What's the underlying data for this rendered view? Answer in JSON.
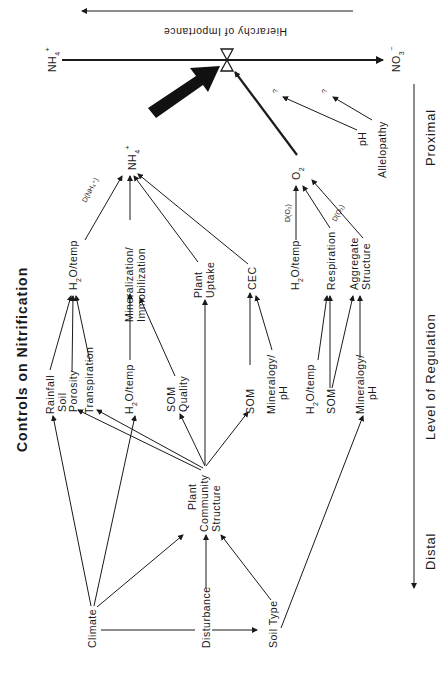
{
  "title": "Controls on Nitrification",
  "hierarchy_label": "Hierarchy of Importance",
  "axis": {
    "label": "Level of Regulation",
    "proximal": "Proximal",
    "distal": "Distal"
  },
  "main_line": {
    "left": "NH",
    "left_sub": "4",
    "left_sup": "+",
    "right": "NO",
    "right_sub": "3",
    "right_sup": "−"
  },
  "nodes": {
    "nh4": {
      "text": "NH",
      "sub": "4",
      "sup": "+"
    },
    "o2": {
      "text": "O",
      "sub": "2"
    },
    "ph_proximal": "pH",
    "allelopathy": "Allelopathy",
    "question1": "?",
    "question2": "?",
    "h2o_temp_nh4": {
      "pre": "H",
      "sub": "2",
      "post": "O/temp"
    },
    "mineralization": [
      "Mineralization/",
      "Immobilization"
    ],
    "plant_uptake": [
      "Plant",
      "Uptake"
    ],
    "cec": "CEC",
    "h2o_temp_o2": {
      "pre": "H",
      "sub": "2",
      "post": "O/temp"
    },
    "respiration": "Respiration",
    "aggregate_structure": [
      "Aggregate",
      "Structure"
    ],
    "rainfall": "Rainfall",
    "soil_porosity": [
      "Soil",
      "Porosity"
    ],
    "transpiration": "Transpiration",
    "h2o_temp_min": {
      "pre": "H",
      "sub": "2",
      "post": "O/temp"
    },
    "som_quality": [
      "SOM",
      "Quality"
    ],
    "som_cec": "SOM",
    "mineralogy_ph_cec": [
      "Mineralogy/",
      "pH"
    ],
    "h2o_temp_resp": {
      "pre": "H",
      "sub": "2",
      "post": "O/temp"
    },
    "som_resp": "SOM",
    "mineralogy_ph_agg": [
      "Mineralogy/",
      "pH"
    ],
    "plant_community": [
      "Plant",
      "Community",
      "Structure"
    ],
    "climate": "Climate",
    "disturbance": "Disturbance",
    "soil_type": "Soil Type"
  },
  "edge_labels": {
    "d_nh4": "D(NH₄⁺)",
    "d_o2_a": "D(O₂)",
    "d_o2_b": "D(O₂)"
  },
  "colors": {
    "ink": "#1a1a1a",
    "background": "#ffffff"
  }
}
